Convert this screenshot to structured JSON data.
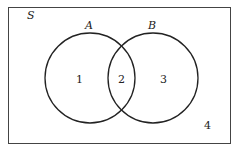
{
  "diagram": {
    "type": "venn",
    "universe_label": "S",
    "sets": [
      {
        "label": "A",
        "cx": 90,
        "cy": 78,
        "r": 45
      },
      {
        "label": "B",
        "cx": 153,
        "cy": 78,
        "r": 45
      }
    ],
    "regions": [
      {
        "label": "1",
        "x": 79,
        "y": 82
      },
      {
        "label": "2",
        "x": 121,
        "y": 82
      },
      {
        "label": "3",
        "x": 163,
        "y": 82
      },
      {
        "label": "4",
        "x": 207,
        "y": 128
      }
    ],
    "colors": {
      "stroke": "#222222",
      "background": "#ffffff"
    }
  }
}
